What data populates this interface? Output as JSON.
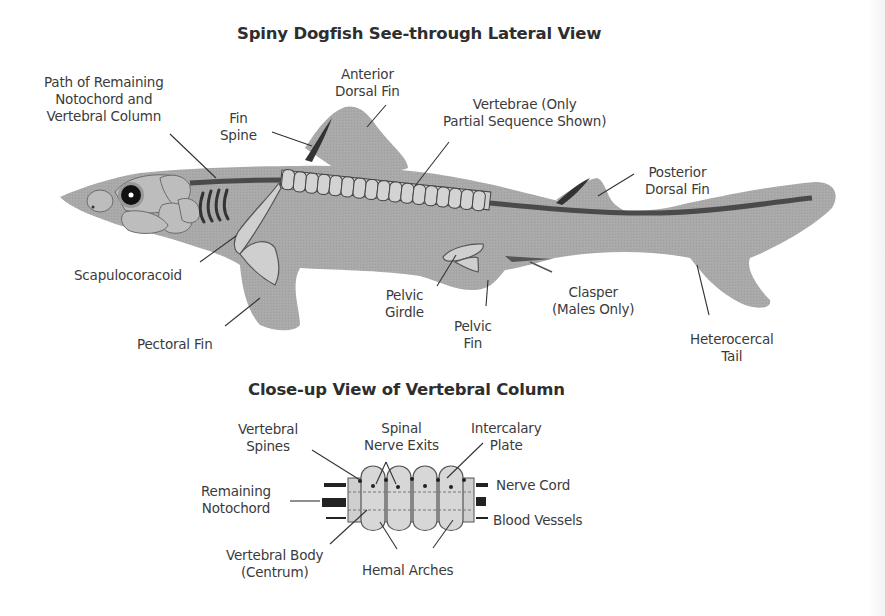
{
  "diagram": {
    "main_title": "Spiny Dogfish See-through Lateral View",
    "closeup_title": "Close-up View of Vertebral Column",
    "colors": {
      "body_fill": "#a8a8a8",
      "body_stroke": "#8e8e8e",
      "notochord": "#555555",
      "vertebra_fill": "#cfcfcf",
      "outline": "#444444",
      "text": "#3b3b3b",
      "background": "#ffffff"
    },
    "lateral_view": {
      "labels": {
        "notochord_path": [
          "Path of Remaining",
          "Notochord and",
          "Vertebral Column"
        ],
        "fin_spine": [
          "Fin",
          "Spine"
        ],
        "anterior_dorsal_fin": [
          "Anterior",
          "Dorsal Fin"
        ],
        "vertebrae": [
          "Vertebrae (Only",
          "Partial Sequence Shown)"
        ],
        "posterior_dorsal_fin": [
          "Posterior",
          "Dorsal Fin"
        ],
        "scapulocoracoid": [
          "Scapulocoracoid"
        ],
        "pectoral_fin": [
          "Pectoral Fin"
        ],
        "pelvic_girdle": [
          "Pelvic",
          "Girdle"
        ],
        "pelvic_fin": [
          "Pelvic",
          "Fin"
        ],
        "clasper": [
          "Clasper",
          "(Males Only)"
        ],
        "heterocercal_tail": [
          "Heterocercal",
          "Tail"
        ]
      },
      "vertebra_count": 17,
      "gill_slit_count": 5
    },
    "closeup_view": {
      "labels": {
        "vertebral_spines": [
          "Vertebral",
          "Spines"
        ],
        "spinal_nerve_exits": [
          "Spinal",
          "Nerve Exits"
        ],
        "intercalary_plate": [
          "Intercalary",
          "Plate"
        ],
        "remaining_notochord": [
          "Remaining",
          "Notochord"
        ],
        "nerve_cord": [
          "Nerve Cord"
        ],
        "blood_vessels": [
          "Blood Vessels"
        ],
        "vertebral_body": [
          "Vertebral Body",
          "(Centrum)"
        ],
        "hemal_arches": [
          "Hemal Arches"
        ]
      },
      "segment_count": 5
    }
  }
}
